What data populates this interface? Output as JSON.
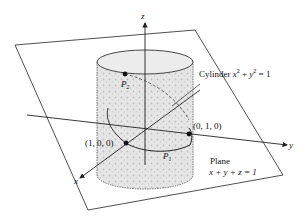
{
  "diagram": {
    "axes": {
      "x": "x",
      "y": "y",
      "z": "z"
    },
    "cylinder": {
      "label_prefix": "Cylinder",
      "equation_lhs": "x² + y²",
      "equation_text": "x2 + y2 = 1",
      "x": "x",
      "y": "y",
      "rhs": "= 1",
      "plus": "+"
    },
    "plane": {
      "label": "Plane",
      "equation": "x + y + z = 1"
    },
    "points": {
      "p1": {
        "name": "P",
        "sub": "1"
      },
      "p2": {
        "name": "P",
        "sub": "2"
      },
      "a": {
        "label": "(1, 0, 0)"
      },
      "b": {
        "label": "(0, 1, 0)"
      }
    },
    "colors": {
      "line": "#222222",
      "fill": "#d9d9d9",
      "background": "#ffffff"
    }
  }
}
